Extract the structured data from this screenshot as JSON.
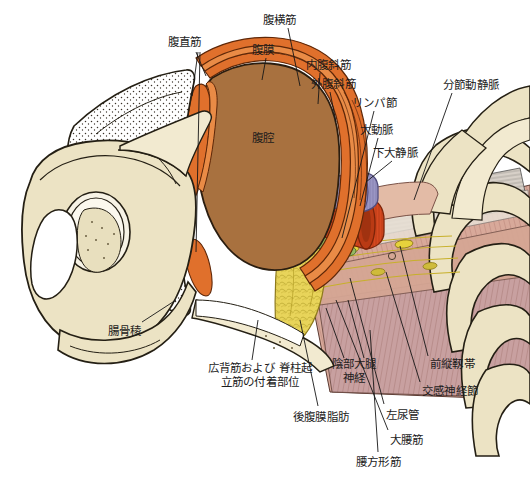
{
  "figure": {
    "background_color": "#ffffff",
    "width": 530,
    "height": 486
  },
  "palette": {
    "bone": "#ece3c4",
    "bone_light": "#f2ead0",
    "bone_outline": "#241f14",
    "cavity_brown": "#a8713f",
    "muscle_orange": "#e0702c",
    "muscle_orange_light": "#e98b46",
    "peritoneum_white": "#fbf8f2",
    "fat_yellow": "#e8d45a",
    "fat_yellow_deep": "#d9c23f",
    "aorta_red": "#d6481f",
    "vena_cava_purple": "#9a96c4",
    "lymph_green": "#8fb35a",
    "muscle_pink": "#d8a99a",
    "muscle_mauve": "#c8a0a0",
    "psoas_tan": "#e3bba6",
    "nerve_yellow": "#e6d23c",
    "leader_line": "#161616",
    "text": "#1c1c1c"
  },
  "cavity_label": {
    "text": "腹腔",
    "meaning": "abdominal-cavity"
  },
  "labels": [
    {
      "id": "rectus-abdominis",
      "text": "腹直筋",
      "x": 168,
      "y": 36,
      "align": "left"
    },
    {
      "id": "peritoneum",
      "text": "腹膜",
      "x": 252,
      "y": 44,
      "align": "left"
    },
    {
      "id": "transversus-abdominis",
      "text": "腹横筋",
      "x": 263,
      "y": 14,
      "align": "left"
    },
    {
      "id": "internal-oblique",
      "text": "内腹斜筋",
      "x": 306,
      "y": 59,
      "align": "left"
    },
    {
      "id": "external-oblique",
      "text": "外腹斜筋",
      "x": 311,
      "y": 78,
      "align": "left"
    },
    {
      "id": "lymph-node",
      "text": "リンパ節",
      "x": 352,
      "y": 97,
      "align": "left"
    },
    {
      "id": "aorta",
      "text": "大動脈",
      "x": 360,
      "y": 124,
      "align": "left"
    },
    {
      "id": "caudal-vena-cava",
      "text": "下大静脈",
      "x": 373,
      "y": 147,
      "align": "left"
    },
    {
      "id": "segmental-vessels",
      "text": "分節動静脈",
      "x": 443,
      "y": 79,
      "align": "left"
    },
    {
      "id": "iliac-crest",
      "text": "腸骨稜",
      "x": 108,
      "y": 325,
      "align": "left"
    },
    {
      "id": "latissimus-erector-attach",
      "text": "広背筋および\n脊柱起立筋の付着部位",
      "x": 212,
      "y": 367,
      "align": "center",
      "multiline": true
    },
    {
      "id": "retroperitoneal-fat",
      "text": "後腹膜脂肪",
      "x": 293,
      "y": 411,
      "align": "left"
    },
    {
      "id": "genitofemoral-nerve",
      "text": "陰部大腿\n神経",
      "x": 330,
      "y": 363,
      "align": "center",
      "multiline": true
    },
    {
      "id": "left-ureter",
      "text": "左尿管",
      "x": 386,
      "y": 409,
      "align": "left"
    },
    {
      "id": "psoas-major",
      "text": "大腰筋",
      "x": 390,
      "y": 434,
      "align": "left"
    },
    {
      "id": "quadratus-lumborum",
      "text": "腰方形筋",
      "x": 356,
      "y": 456,
      "align": "left"
    },
    {
      "id": "sympathetic-ganglion",
      "text": "交感神経節",
      "x": 422,
      "y": 385,
      "align": "left"
    },
    {
      "id": "anterior-longitudinal-ligament",
      "text": "前縦靱帯",
      "x": 430,
      "y": 358,
      "align": "left"
    }
  ]
}
